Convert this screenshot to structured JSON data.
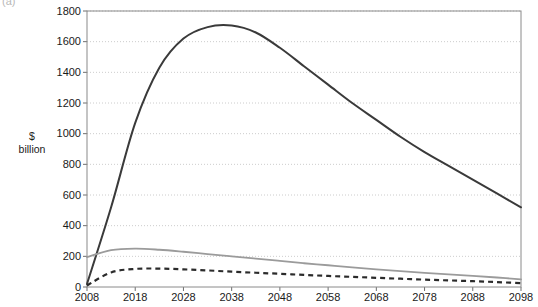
{
  "figure": {
    "panel_label": "(a)",
    "y_axis_title_line1": "$",
    "y_axis_title_line2": "billion"
  },
  "chart_data": {
    "type": "line",
    "title": "",
    "xlabel": "",
    "ylabel": "$ billion",
    "xlim": [
      2008,
      2098
    ],
    "ylim": [
      0,
      1800
    ],
    "xticks": [
      2008,
      2018,
      2028,
      2038,
      2048,
      2058,
      2068,
      2078,
      2088,
      2098
    ],
    "yticks": [
      0,
      200,
      400,
      600,
      800,
      1000,
      1200,
      1400,
      1600,
      1800
    ],
    "xtick_labels": [
      "2008",
      "2018",
      "2028",
      "2038",
      "2048",
      "2058",
      "2068",
      "2078",
      "2088",
      "2098"
    ],
    "ytick_labels": [
      "0",
      "200",
      "400",
      "600",
      "800",
      "1000",
      "1200",
      "1400",
      "1600",
      "1800"
    ],
    "grid": true,
    "grid_axis": "y",
    "legend": "none",
    "x": [
      2008,
      2013,
      2018,
      2023,
      2028,
      2033,
      2038,
      2043,
      2048,
      2053,
      2058,
      2063,
      2068,
      2073,
      2078,
      2083,
      2088,
      2093,
      2098
    ],
    "series": [
      {
        "name": "series-1-solid-dark",
        "style": "solid",
        "color": "#3a3a3a",
        "width": 2.0,
        "values": [
          20,
          520,
          1070,
          1430,
          1620,
          1695,
          1705,
          1660,
          1560,
          1440,
          1320,
          1200,
          1090,
          980,
          880,
          790,
          700,
          610,
          520
        ]
      },
      {
        "name": "series-2-solid-gray",
        "style": "solid",
        "color": "#9b9b9b",
        "width": 1.8,
        "values": [
          195,
          240,
          250,
          243,
          230,
          215,
          200,
          185,
          170,
          155,
          142,
          128,
          115,
          103,
          92,
          82,
          72,
          62,
          50
        ]
      },
      {
        "name": "series-3-dashed-dark",
        "style": "dashed",
        "color": "#2b2b2b",
        "width": 2.2,
        "values": [
          10,
          95,
          118,
          120,
          115,
          108,
          100,
          93,
          86,
          79,
          72,
          66,
          60,
          54,
          48,
          43,
          38,
          32,
          25
        ]
      }
    ]
  },
  "plot_geometry": {
    "left": 87,
    "right": 521,
    "top": 11,
    "bottom": 287
  }
}
